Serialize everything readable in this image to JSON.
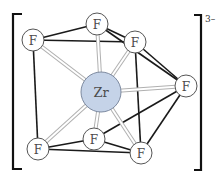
{
  "diagram": {
    "charge": "3–",
    "central_atom": {
      "label": "Zr",
      "x": 101,
      "y": 92,
      "r": 20,
      "fill": "#c5d3e8",
      "stroke": "#7d8aa0"
    },
    "ligands": [
      {
        "id": "F1",
        "label": "F",
        "x": 33,
        "y": 40,
        "position": "top-left"
      },
      {
        "id": "F2",
        "label": "F",
        "x": 97,
        "y": 24,
        "position": "top"
      },
      {
        "id": "F3",
        "label": "F",
        "x": 135,
        "y": 42,
        "position": "top-right"
      },
      {
        "id": "F4",
        "label": "F",
        "x": 186,
        "y": 86,
        "position": "right"
      },
      {
        "id": "F5",
        "label": "F",
        "x": 141,
        "y": 153,
        "position": "bottom-right"
      },
      {
        "id": "F6",
        "label": "F",
        "x": 94,
        "y": 139,
        "position": "bottom-center"
      },
      {
        "id": "F7",
        "label": "F",
        "x": 38,
        "y": 149,
        "position": "bottom-left"
      }
    ],
    "ligand_radius": 11,
    "ligand_fill": "#ffffff",
    "ligand_stroke": "#555555",
    "zr_bonds": [
      "F1",
      "F2",
      "F3",
      "F4",
      "F5",
      "F6",
      "F7"
    ],
    "polyhedron_edges": [
      [
        "F1",
        "F2"
      ],
      [
        "F1",
        "F3"
      ],
      [
        "F2",
        "F3"
      ],
      [
        "F2",
        "F4"
      ],
      [
        "F3",
        "F4"
      ],
      [
        "F3",
        "F5"
      ],
      [
        "F1",
        "F7"
      ],
      [
        "F4",
        "F5"
      ],
      [
        "F4",
        "F6"
      ],
      [
        "F6",
        "F5"
      ],
      [
        "F7",
        "F6"
      ],
      [
        "F7",
        "F5"
      ]
    ],
    "edge_color": "#1a1a1a",
    "bond_color": "#c8c8c8",
    "bracket_color": "#111111"
  }
}
